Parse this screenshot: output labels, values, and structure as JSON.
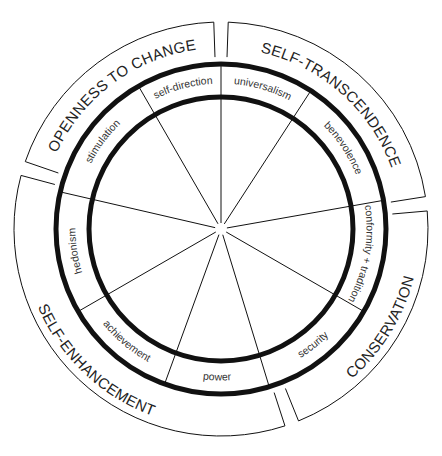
{
  "diagram": {
    "center": [
      221,
      229
    ],
    "radii": {
      "inner_ring": 132,
      "outer_ring": 165,
      "band_inner": 172,
      "band_outer": 207
    },
    "colors": {
      "stroke": "#111111",
      "text": "#333333",
      "background": "#ffffff"
    },
    "values": [
      {
        "id": "universalism",
        "label": "universalism",
        "start": 57,
        "end": 90
      },
      {
        "id": "benevolence",
        "label": "benevolence",
        "start": 10,
        "end": 57
      },
      {
        "id": "conformity-tradition",
        "label": "conformity + tradition",
        "start": -30,
        "end": 10
      },
      {
        "id": "security",
        "label": "security",
        "start": -73,
        "end": -30
      },
      {
        "id": "power",
        "label": "power",
        "start": -110,
        "end": -73
      },
      {
        "id": "achievement",
        "label": "achievement",
        "start": -150,
        "end": -110
      },
      {
        "id": "hedonism",
        "label": "hedonism",
        "start": 167,
        "end": 210
      },
      {
        "id": "stimulation",
        "label": "stimulation",
        "start": 120,
        "end": 167
      },
      {
        "id": "self-direction",
        "label": "self-direction",
        "start": 90,
        "end": 120
      }
    ],
    "domains": [
      {
        "id": "self-transcendence",
        "label": "SELF-TRANSCENDENCE",
        "start": 9,
        "end": 88
      },
      {
        "id": "conservation",
        "label": "CONSERVATION",
        "start": -68,
        "end": 5
      },
      {
        "id": "self-enhancement",
        "label": "SELF-ENHANCEMENT",
        "start": -195,
        "end": -72
      },
      {
        "id": "openness-to-change",
        "label": "OPENNESS TO CHANGE",
        "start": 92,
        "end": 161
      }
    ]
  }
}
